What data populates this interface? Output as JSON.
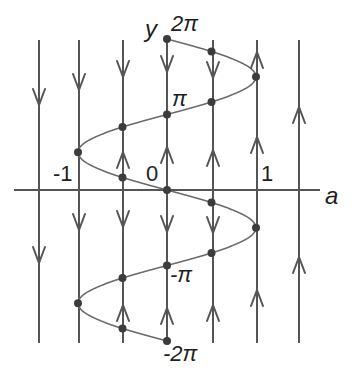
{
  "diagram": {
    "colors": {
      "background": "#ffffff",
      "line": "#555555",
      "curve": "#6a6a6a",
      "dot": "#3c3c3c",
      "text": "#1f1f1f"
    },
    "axes": {
      "horizontal_label": "a",
      "vertical_label": "y",
      "a_ticks": [
        {
          "value": -1,
          "label": "-1"
        },
        {
          "value": 0,
          "label": "0"
        },
        {
          "value": 1,
          "label": "1"
        }
      ],
      "y_ticks": [
        {
          "value": "2π",
          "label": "2π"
        },
        {
          "value": "π",
          "label": "π"
        },
        {
          "value": "-π",
          "label": "-π"
        },
        {
          "value": "-2π",
          "label": "-2π"
        }
      ]
    },
    "curve": {
      "equation": "a = -sin(y)",
      "y_range": [
        "-2π",
        "2π"
      ]
    },
    "phase_lines": [
      {
        "a": -1.45,
        "arrows": [
          "down",
          "down"
        ]
      },
      {
        "a": -1.0,
        "arrows": [
          "down",
          "down"
        ]
      },
      {
        "a": -0.5,
        "arrows": [
          "down",
          "up",
          "down",
          "up"
        ]
      },
      {
        "a": 0.0,
        "arrows": [
          "down",
          "up",
          "down",
          "up"
        ]
      },
      {
        "a": 0.5,
        "arrows": [
          "down",
          "up",
          "down",
          "up"
        ]
      },
      {
        "a": 1.0,
        "arrows": [
          "up",
          "up",
          "up"
        ]
      },
      {
        "a": 1.45,
        "arrows": [
          "up",
          "up"
        ]
      }
    ],
    "equilibria": [
      {
        "a": 0,
        "y": "2π"
      },
      {
        "a": 0.5,
        "y": "11π/6"
      },
      {
        "a": 1,
        "y": "3π/2"
      },
      {
        "a": 0.5,
        "y": "7π/6"
      },
      {
        "a": 0,
        "y": "π"
      },
      {
        "a": -0.5,
        "y": "5π/6"
      },
      {
        "a": -1,
        "y": "π/2"
      },
      {
        "a": -0.5,
        "y": "π/6"
      },
      {
        "a": 0,
        "y": "0"
      },
      {
        "a": 0.5,
        "y": "-π/6"
      },
      {
        "a": 1,
        "y": "-π/2"
      },
      {
        "a": 0.5,
        "y": "-5π/6"
      },
      {
        "a": 0,
        "y": "-π"
      },
      {
        "a": -0.5,
        "y": "-7π/6"
      },
      {
        "a": -1,
        "y": "-3π/2"
      },
      {
        "a": -0.5,
        "y": "-11π/6"
      },
      {
        "a": 0,
        "y": "-2π"
      }
    ]
  }
}
